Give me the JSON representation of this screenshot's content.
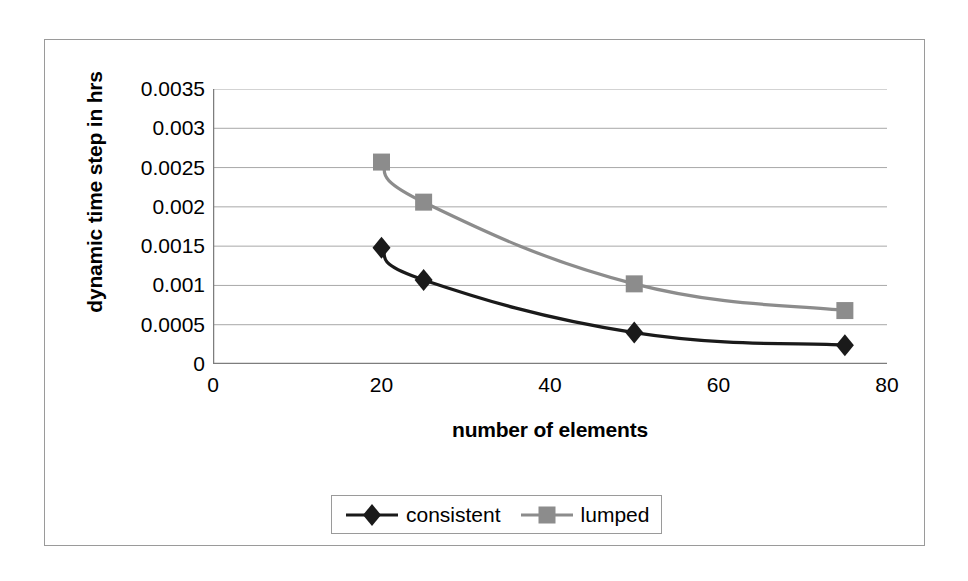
{
  "chart_data": {
    "type": "line",
    "title": "",
    "xlabel": "number of elements",
    "ylabel": "dynamic time step in hrs",
    "xlim": [
      0,
      80
    ],
    "ylim": [
      0,
      0.0035
    ],
    "grid": true,
    "legend_position": "bottom",
    "x_ticks": [
      "0",
      "20",
      "40",
      "60",
      "80"
    ],
    "x_tick_values": [
      0,
      20,
      40,
      60,
      80
    ],
    "y_ticks": [
      "0",
      "0.0005",
      "0.001",
      "0.0015",
      "0.002",
      "0.0025",
      "0.003",
      "0.0035"
    ],
    "y_tick_values": [
      0,
      0.0005,
      0.001,
      0.0015,
      0.002,
      0.0025,
      0.003,
      0.0035
    ],
    "x": [
      20,
      25,
      50,
      75
    ],
    "series": [
      {
        "name": "consistent",
        "marker": "diamond",
        "color": "#1a1a1a",
        "values": [
          0.00148,
          0.00107,
          0.0004,
          0.00024
        ]
      },
      {
        "name": "lumped",
        "marker": "square",
        "color": "#8c8c8c",
        "values": [
          0.00257,
          0.00206,
          0.00102,
          0.00068
        ]
      }
    ]
  },
  "axes": {
    "y_title": "dynamic time step in hrs",
    "x_title": "number of elements"
  },
  "legend": {
    "entries": [
      {
        "label": "consistent",
        "marker": "diamond",
        "color": "#1a1a1a"
      },
      {
        "label": "lumped",
        "marker": "square",
        "color": "#8c8c8c"
      }
    ]
  },
  "colors": {
    "consistent": "#1a1a1a",
    "lumped": "#8c8c8c",
    "grid": "#a8a8a8",
    "axis": "#7d7d7d",
    "frame": "#9a9a9a",
    "background": "#ffffff"
  }
}
